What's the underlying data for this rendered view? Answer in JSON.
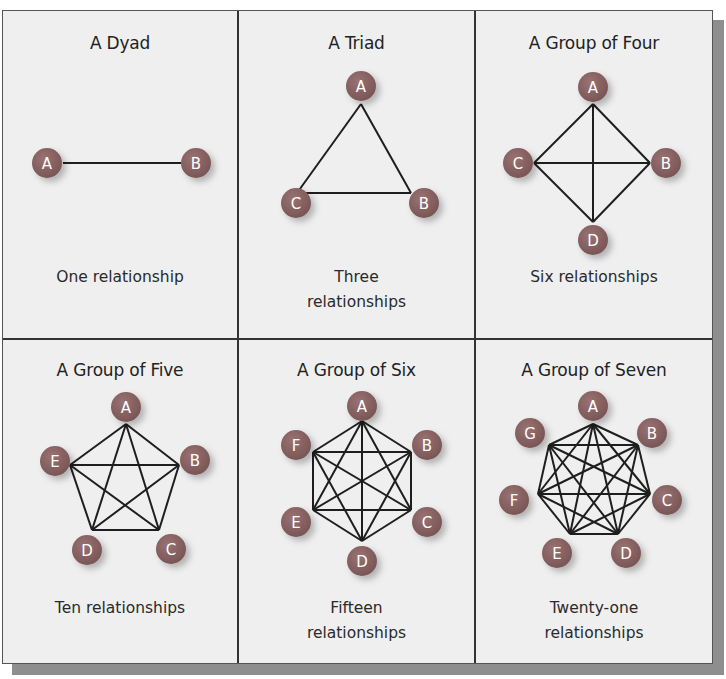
{
  "colors": {
    "node": "#7a5656",
    "node_highlight": "#9a7272",
    "edge": "#1e1e1e",
    "panel_bg": "#efefef",
    "divider": "#333333",
    "shadow": "#8e8e8e"
  },
  "panels": [
    {
      "title": "A Dyad",
      "caption_lines": [
        "One relationship"
      ],
      "nodes": [
        "A",
        "B"
      ],
      "edge_count": 1
    },
    {
      "title": "A Triad",
      "caption_lines": [
        "Three",
        "relationships"
      ],
      "nodes": [
        "A",
        "B",
        "C"
      ],
      "edge_count": 3
    },
    {
      "title": "A Group of Four",
      "caption_lines": [
        "Six relationships"
      ],
      "nodes": [
        "A",
        "B",
        "C",
        "D"
      ],
      "edge_count": 6
    },
    {
      "title": "A Group of Five",
      "caption_lines": [
        "Ten relationships"
      ],
      "nodes": [
        "A",
        "B",
        "C",
        "D",
        "E"
      ],
      "edge_count": 10
    },
    {
      "title": "A Group of Six",
      "caption_lines": [
        "Fifteen",
        "relationships"
      ],
      "nodes": [
        "A",
        "B",
        "C",
        "D",
        "E",
        "F"
      ],
      "edge_count": 15
    },
    {
      "title": "A Group of Seven",
      "caption_lines": [
        "Twenty-one",
        "relationships"
      ],
      "nodes": [
        "A",
        "B",
        "C",
        "D",
        "E",
        "F",
        "G"
      ],
      "edge_count": 21
    }
  ]
}
